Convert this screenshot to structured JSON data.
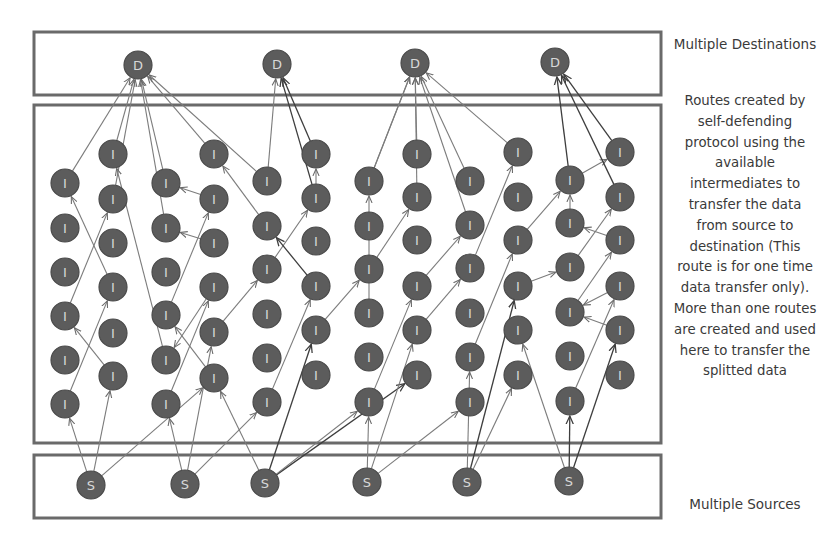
{
  "labels": {
    "destinations": "Multiple Destinations",
    "routes_description": "Routes created by self-defending protocol using the available intermediates to transfer the data from source to destination (This route is for one time data transfer only). More than one routes are created and used here to transfer the splitted data",
    "sources": "Multiple Sources"
  },
  "node_labels": {
    "destination": "D",
    "intermediate": "I",
    "source": "S"
  },
  "colors": {
    "node_fill": "#5c5c5c",
    "node_text": "#d8d8d8",
    "edge": "#7c7c7c",
    "edge_dark": "#3e3e3e",
    "box": "#6a6a6a",
    "text": "#3a3a3a"
  },
  "boxes": [
    {
      "name": "destinations-box",
      "x": 34,
      "y": 32,
      "w": 627,
      "h": 63
    },
    {
      "name": "intermediates-box",
      "x": 34,
      "y": 105,
      "w": 627,
      "h": 338
    },
    {
      "name": "sources-box",
      "x": 34,
      "y": 455,
      "w": 627,
      "h": 63
    }
  ],
  "destinations": [
    {
      "id": "D1",
      "x": 138,
      "y": 65
    },
    {
      "id": "D2",
      "x": 277,
      "y": 64
    },
    {
      "id": "D3",
      "x": 415,
      "y": 63
    },
    {
      "id": "D4",
      "x": 555,
      "y": 62
    }
  ],
  "sources": [
    {
      "id": "S1",
      "x": 91,
      "y": 485
    },
    {
      "id": "S2",
      "x": 185,
      "y": 484
    },
    {
      "id": "S3",
      "x": 265,
      "y": 483
    },
    {
      "id": "S4",
      "x": 367,
      "y": 482
    },
    {
      "id": "S5",
      "x": 467,
      "y": 482
    },
    {
      "id": "S6",
      "x": 569,
      "y": 481
    }
  ],
  "intermediate_columns": [
    {
      "x": 65,
      "ys": [
        183,
        228,
        272,
        316,
        360,
        404
      ]
    },
    {
      "x": 113,
      "ys": [
        154,
        199,
        243,
        287,
        333,
        376
      ]
    },
    {
      "x": 166,
      "ys": [
        183,
        228,
        272,
        315,
        360,
        404
      ]
    },
    {
      "x": 214,
      "ys": [
        154,
        199,
        243,
        287,
        332,
        378
      ]
    },
    {
      "x": 267,
      "ys": [
        181,
        226,
        269,
        314,
        358,
        402
      ]
    },
    {
      "x": 316,
      "ys": [
        154,
        198,
        241,
        286,
        330,
        375
      ]
    },
    {
      "x": 369,
      "ys": [
        181,
        226,
        269,
        313,
        357,
        402
      ]
    },
    {
      "x": 417,
      "ys": [
        154,
        197,
        240,
        286,
        330,
        375
      ]
    },
    {
      "x": 470,
      "ys": [
        181,
        225,
        268,
        313,
        357,
        402
      ]
    },
    {
      "x": 518,
      "ys": [
        152,
        197,
        240,
        286,
        330,
        375
      ]
    },
    {
      "x": 570,
      "ys": [
        180,
        223,
        267,
        312,
        356,
        401
      ]
    },
    {
      "x": 620,
      "ys": [
        152,
        197,
        240,
        286,
        330,
        375
      ]
    }
  ],
  "edges": [
    [
      "S1",
      "I0_5"
    ],
    [
      "S1",
      "I1_5"
    ],
    [
      "S1",
      "I3_5"
    ],
    [
      "I0_5",
      "I1_3"
    ],
    [
      "I1_5",
      "I0_3"
    ],
    [
      "I0_3",
      "I1_1"
    ],
    [
      "I1_1",
      "D1"
    ],
    [
      "I0_0",
      "D1"
    ],
    [
      "I1_3",
      "I0_0"
    ],
    [
      "S2",
      "I2_5"
    ],
    [
      "S2",
      "I3_4"
    ],
    [
      "S2",
      "I4_5"
    ],
    [
      "I2_5",
      "I3_3"
    ],
    [
      "I3_5",
      "I2_3"
    ],
    [
      "I2_3",
      "I3_1"
    ],
    [
      "I3_1",
      "I2_0"
    ],
    [
      "I2_0",
      "D1"
    ],
    [
      "I3_3",
      "I2_4"
    ],
    [
      "I2_4",
      "I1_0"
    ],
    [
      "I1_0",
      "D1"
    ],
    [
      "I3_4",
      "I4_2"
    ],
    [
      "I4_2",
      "I5_1"
    ],
    [
      "I5_1",
      "I5_0"
    ],
    [
      "I5_0",
      "D2"
    ],
    [
      "I5_1",
      "D2"
    ],
    [
      "I3_0",
      "D1"
    ],
    [
      "I3_2",
      "I2_1"
    ],
    [
      "I2_1",
      "D1"
    ],
    [
      "S3",
      "I3_5"
    ],
    [
      "S3",
      "I5_4"
    ],
    [
      "S3",
      "I7_5"
    ],
    [
      "S3",
      "I6_5"
    ],
    [
      "I4_5",
      "I5_3"
    ],
    [
      "I5_3",
      "I4_1"
    ],
    [
      "I4_1",
      "I3_0"
    ],
    [
      "I4_0",
      "D1"
    ],
    [
      "I4_0",
      "D2"
    ],
    [
      "I5_4",
      "I6_2"
    ],
    [
      "I6_2",
      "I7_1"
    ],
    [
      "I7_1",
      "D3"
    ],
    [
      "I6_0",
      "D3"
    ],
    [
      "I7_0",
      "D3"
    ],
    [
      "S4",
      "I6_5"
    ],
    [
      "S4",
      "I7_4"
    ],
    [
      "S4",
      "I8_5"
    ],
    [
      "I6_5",
      "I7_3"
    ],
    [
      "I7_3",
      "I8_1"
    ],
    [
      "I8_1",
      "D3"
    ],
    [
      "I6_3",
      "I6_0"
    ],
    [
      "I6_0",
      "D3"
    ],
    [
      "I7_4",
      "I8_2"
    ],
    [
      "I8_2",
      "I9_0"
    ],
    [
      "I9_0",
      "D3"
    ],
    [
      "I8_0",
      "D3"
    ],
    [
      "S5",
      "I8_4"
    ],
    [
      "S5",
      "I9_3"
    ],
    [
      "S5",
      "I9_5"
    ],
    [
      "I8_4",
      "I9_2"
    ],
    [
      "I9_2",
      "I10_0"
    ],
    [
      "I10_0",
      "I11_0"
    ],
    [
      "I11_0",
      "D4"
    ],
    [
      "I10_0",
      "D4"
    ],
    [
      "I9_3",
      "I10_2"
    ],
    [
      "I10_2",
      "I11_1"
    ],
    [
      "I11_1",
      "D4"
    ],
    [
      "S6",
      "I10_5"
    ],
    [
      "S6",
      "I11_4"
    ],
    [
      "S6",
      "I9_4"
    ],
    [
      "I10_5",
      "I11_3"
    ],
    [
      "I11_3",
      "I10_3"
    ],
    [
      "I10_3",
      "I11_2"
    ],
    [
      "I11_2",
      "I10_1"
    ],
    [
      "I10_1",
      "I10_0"
    ],
    [
      "I11_4",
      "I10_3"
    ]
  ],
  "dark_edges": [
    [
      "S3",
      "I5_4"
    ],
    [
      "S3",
      "I7_5"
    ],
    [
      "I5_3",
      "I4_1"
    ],
    [
      "I5_1",
      "D2"
    ],
    [
      "I5_0",
      "D2"
    ],
    [
      "S6",
      "I10_5"
    ],
    [
      "S6",
      "I11_4"
    ],
    [
      "I10_0",
      "D4"
    ],
    [
      "I11_0",
      "D4"
    ],
    [
      "I11_1",
      "D4"
    ],
    [
      "S5",
      "I9_3"
    ]
  ]
}
